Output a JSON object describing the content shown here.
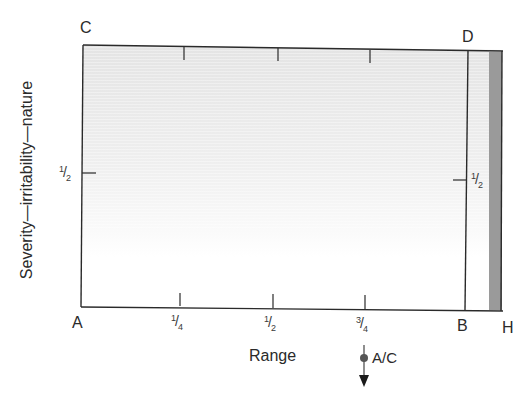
{
  "diagram": {
    "type": "movement-diagram",
    "corners": {
      "top_left": "C",
      "top_right": "D",
      "bottom_left": "A",
      "bottom_right": "B",
      "far_right": "H"
    },
    "x_axis": {
      "title": "Range",
      "ticks": [
        {
          "label_num": "1",
          "label_den": "4",
          "value": 0.25
        },
        {
          "label_num": "1",
          "label_den": "2",
          "value": 0.5
        },
        {
          "label_num": "3",
          "label_den": "4",
          "value": 0.75
        }
      ]
    },
    "y_axis": {
      "title": "Severity—irritability—nature",
      "left_tick": {
        "label_num": "1",
        "label_den": "2",
        "value": 0.5
      },
      "right_tick": {
        "label_num": "1",
        "label_den": "2",
        "value": 0.5
      }
    },
    "marker": {
      "label": "A/C",
      "position_fraction": 0.75,
      "symbol": "filled-dot-with-down-arrow"
    },
    "colors": {
      "line": "#2a2a2a",
      "shading_top": "#e6e6e6",
      "shading_bottom": "#ffffff",
      "end_strip": "#9a9a9a",
      "marker_dot": "#555555"
    }
  }
}
